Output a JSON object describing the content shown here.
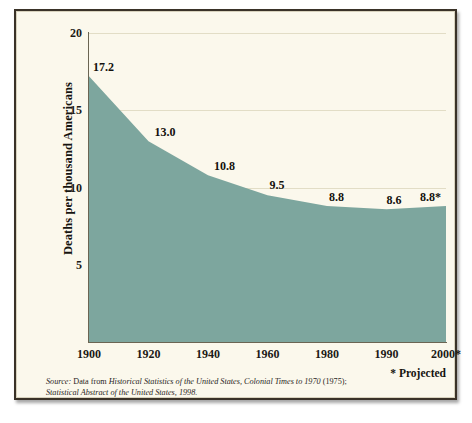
{
  "chart_data": {
    "type": "area",
    "title": "",
    "xlabel": "",
    "ylabel": "Deaths per thousand Americans",
    "categories": [
      "1900",
      "1920",
      "1940",
      "1960",
      "1980",
      "1990",
      "2000*"
    ],
    "values": [
      17.2,
      13.0,
      10.8,
      9.5,
      8.8,
      8.6,
      8.8
    ],
    "point_labels": [
      "17.2",
      "13.0",
      "10.8",
      "9.5",
      "8.8",
      "8.6",
      "8.8*"
    ],
    "ylim": [
      0,
      20
    ],
    "yticks": [
      5,
      10,
      15,
      20
    ],
    "ytick_labels": [
      "5",
      "10",
      "15",
      "20"
    ],
    "grid": true,
    "grid_axis": "y",
    "legend": "none",
    "series": [
      {
        "name": "Death rate per thousand Americans",
        "values": [
          17.2,
          13.0,
          10.8,
          9.5,
          8.8,
          8.6,
          8.8
        ]
      }
    ],
    "annotations": [
      "* Projected"
    ],
    "colors": {
      "area_fill": "#7da69e",
      "background": "#fbf8ec",
      "frame": "#3a3228",
      "gridline": "#e2ddc6",
      "axis": "#6b6553",
      "text": "#1c1a16"
    }
  },
  "notes": {
    "projected": "* Projected",
    "source_lead": "Source:",
    "source_body_1": " Data from ",
    "source_italic_1": "Historical Statistics of the United States, Colonial Times to 1970",
    "source_body_2": " (1975);",
    "source_italic_2": "Statistical Abstract of the United States, 1998."
  }
}
